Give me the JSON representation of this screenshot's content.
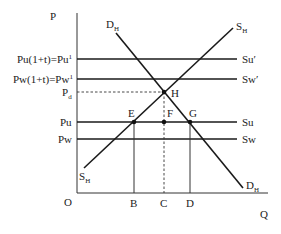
{
  "diagram": {
    "type": "supply-demand with tariff (economics)",
    "axes": {
      "y_label": "P",
      "x_label": "Q",
      "origin_label": "O"
    },
    "price_levels": [
      {
        "id": "pu1",
        "label": "Pu(1+t)=Pu",
        "superscript": "1",
        "line_label": "Su′",
        "style": "solid"
      },
      {
        "id": "pw1",
        "label": "Pw(1+t)=Pw",
        "superscript": "1",
        "line_label": "Sw′",
        "style": "solid"
      },
      {
        "id": "pd",
        "label": "P",
        "subscript": "d",
        "style": "dashed"
      },
      {
        "id": "pu",
        "label": "Pu",
        "line_label": "Su",
        "style": "solid"
      },
      {
        "id": "pw",
        "label": "Pw",
        "line_label": "Sw",
        "style": "solid"
      }
    ],
    "curves": {
      "supply": {
        "label": "S",
        "subscript": "H"
      },
      "demand": {
        "label": "D",
        "subscript": "H"
      }
    },
    "points": {
      "E": "E",
      "F": "F",
      "G": "G",
      "H": "H"
    },
    "quantity_marks": [
      "B",
      "C",
      "D"
    ],
    "colors": {
      "line": "#1a1a1a",
      "background": "#ffffff"
    }
  }
}
